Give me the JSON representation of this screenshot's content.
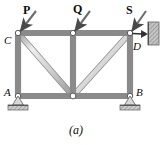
{
  "figure": {
    "caption": "(a)",
    "type": "truss-free-body-diagram"
  },
  "load_labels": [
    {
      "text": "P",
      "x": 23,
      "y": 5
    },
    {
      "text": "Q",
      "x": 74,
      "y": 4
    },
    {
      "text": "S",
      "x": 126,
      "y": 5
    }
  ],
  "joint_labels": [
    {
      "text": "C",
      "x": 4,
      "y": 35
    },
    {
      "text": "D",
      "x": 133,
      "y": 42
    },
    {
      "text": "A",
      "x": 4,
      "y": 88
    },
    {
      "text": "B",
      "x": 136,
      "y": 88
    }
  ],
  "colors": {
    "member_fill": "#d3d3d3",
    "member_edge": "#8a8a8a",
    "member_highlight": "#f2f2f2",
    "arrow": "#4a4a4a",
    "joint_fill": "#ffffff",
    "joint_edge": "#5a5a5a",
    "ground_fill": "#c9c9c9",
    "ground_edge": "#6e6e6e",
    "wall_fill": "#c4c4c4",
    "text": "#0d0d0d"
  },
  "geometry": {
    "nodes": {
      "C": {
        "x": 18,
        "y": 33
      },
      "Mtop": {
        "x": 73,
        "y": 33
      },
      "D": {
        "x": 130,
        "y": 33
      },
      "A": {
        "x": 18,
        "y": 96
      },
      "Mbot": {
        "x": 73,
        "y": 96
      },
      "B": {
        "x": 130,
        "y": 96
      }
    },
    "members": [
      {
        "from": "C",
        "to": "Mtop",
        "kind": "top-chord"
      },
      {
        "from": "Mtop",
        "to": "D",
        "kind": "top-chord"
      },
      {
        "from": "A",
        "to": "Mbot",
        "kind": "bottom-chord"
      },
      {
        "from": "Mbot",
        "to": "B",
        "kind": "bottom-chord"
      },
      {
        "from": "C",
        "to": "A",
        "kind": "vertical"
      },
      {
        "from": "Mtop",
        "to": "Mbot",
        "kind": "vertical"
      },
      {
        "from": "D",
        "to": "B",
        "kind": "vertical"
      },
      {
        "from": "C",
        "to": "Mbot",
        "kind": "diagonal"
      },
      {
        "from": "D",
        "to": "Mbot",
        "kind": "diagonal"
      }
    ],
    "load_arrows": [
      {
        "name": "P",
        "x1": 36,
        "y1": 11,
        "x2": 19,
        "y2": 32
      },
      {
        "name": "Q",
        "x1": 90,
        "y1": 11,
        "x2": 74,
        "y2": 32
      },
      {
        "name": "S",
        "x1": 146,
        "y1": 11,
        "x2": 131,
        "y2": 32
      }
    ],
    "reaction_arrow": {
      "name": "D-link",
      "x1": 131,
      "y1": 33,
      "x2": 147,
      "y2": 34
    },
    "wall": {
      "x": 148,
      "y": 22,
      "w": 11,
      "h": 23
    },
    "supports": [
      {
        "name": "A",
        "x": 18,
        "y": 96
      },
      {
        "name": "B",
        "x": 130,
        "y": 96
      }
    ]
  }
}
